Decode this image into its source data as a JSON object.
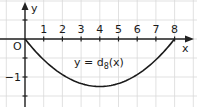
{
  "chart_data": {
    "type": "line",
    "title": "",
    "xlabel": "x",
    "ylabel": "y",
    "annotation": "y = d8(x)",
    "annotation_main": "y = d",
    "annotation_sub": "8",
    "annotation_tail": "(x)",
    "origin_label": "O",
    "x_ticks": [
      "1",
      "2",
      "3",
      "4",
      "5",
      "6",
      "7",
      "8"
    ],
    "y_ticks": [
      "-1"
    ],
    "xlim": [
      -0.5,
      9
    ],
    "ylim": [
      -1.75,
      0.9
    ],
    "grid": true,
    "series": [
      {
        "name": "d8(x)",
        "x": [
          0,
          1,
          2,
          3,
          4,
          5,
          6,
          7,
          8
        ],
        "y": [
          0,
          -0.55,
          -0.94,
          -1.17,
          -1.25,
          -1.17,
          -0.94,
          -0.55,
          0
        ]
      }
    ],
    "colors": {
      "grid": "#d9d9d9",
      "axis": "#222222",
      "curve": "#1a1a1a"
    }
  }
}
